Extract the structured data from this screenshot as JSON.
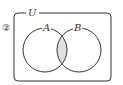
{
  "problem_number": "②",
  "universe_label": "U",
  "sets": [
    {
      "name": "A"
    },
    {
      "name": "B"
    }
  ],
  "shaded_region": "A ∩ B",
  "colors": {
    "stroke": "#333333",
    "shade": "#e0e0e0"
  }
}
